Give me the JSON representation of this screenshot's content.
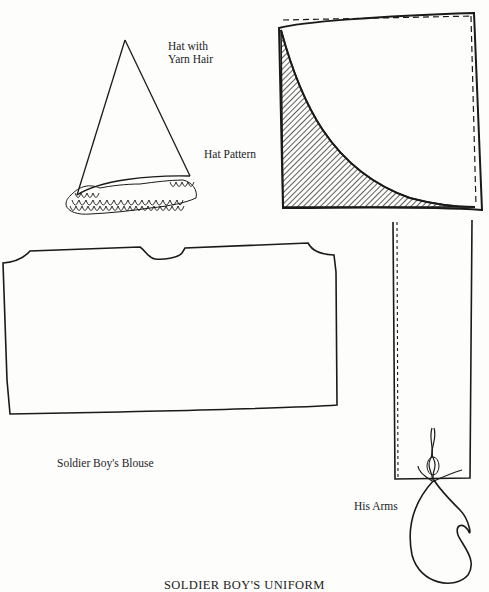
{
  "page": {
    "title": "SOLDIER BOY'S UNIFORM"
  },
  "labels": {
    "hat_with_yarn_hair_line1": "Hat with",
    "hat_with_yarn_hair_line2": "Yarn Hair",
    "hat_pattern": "Hat Pattern",
    "blouse": "Soldier Boy's Blouse",
    "arms": "His Arms"
  },
  "illustrations": [
    {
      "name": "hat-with-yarn-hair",
      "description": "cone-shaped hat with looped yarn hair fringe"
    },
    {
      "name": "hat-pattern",
      "description": "square pattern with dashed seam lines and hatched quarter-circle cut-away"
    },
    {
      "name": "blouse-pattern",
      "description": "rectangular blouse pattern with neck notch and shoulder curves"
    },
    {
      "name": "arm-pattern",
      "description": "long rectangular strip with dashed seam and yarn hand loop"
    }
  ],
  "colors": {
    "ink": "#1a1a1a",
    "paper": "#fdfdfc"
  }
}
